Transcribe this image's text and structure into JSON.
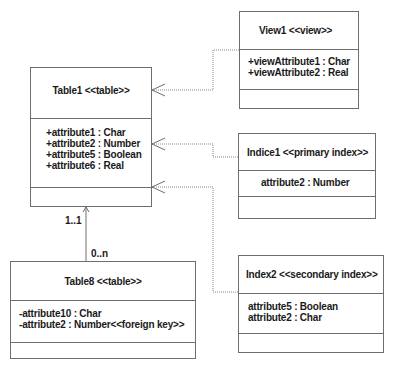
{
  "diagram": {
    "type": "UML class diagram (database schema)",
    "classes": [
      {
        "id": "table1",
        "title": "Table1 <<table>>",
        "attributes": [
          "+attribute1 : Char",
          "+attribute2 : Number",
          "+attribute5 : Boolean",
          "+attribute6 : Real"
        ]
      },
      {
        "id": "view1",
        "title": "View1 <<view>>",
        "attributes": [
          "+viewAttribute1 : Char",
          "+viewAttribute2 : Real"
        ]
      },
      {
        "id": "indice1",
        "title": "Indice1 <<primary index>>",
        "attributes": [
          "attribute2 : Number"
        ]
      },
      {
        "id": "index2",
        "title": "Index2 <<secondary index>>",
        "attributes": [
          "attribute5 : Boolean",
          "attribute2 : Char"
        ]
      },
      {
        "id": "table8",
        "title": "Table8 <<table>>",
        "attributes": [
          "-attribute10 : Char",
          "-attribute2 : Number<<foreign key>>"
        ]
      }
    ],
    "relations": [
      {
        "from": "view1",
        "to": "table1",
        "kind": "dependency"
      },
      {
        "from": "indice1",
        "to": "table1",
        "kind": "dependency"
      },
      {
        "from": "index2",
        "to": "table1",
        "kind": "dependency"
      },
      {
        "from": "table8",
        "to": "table1",
        "kind": "association",
        "source_multiplicity": "0..n",
        "target_multiplicity": "1..1"
      }
    ],
    "multiplicities": {
      "table1_end": "1..1",
      "table8_end": "0..n"
    },
    "colors": {
      "line": "#6e6e6e",
      "dotted": "#8a8a8a",
      "text": "#1a1a1a"
    }
  }
}
